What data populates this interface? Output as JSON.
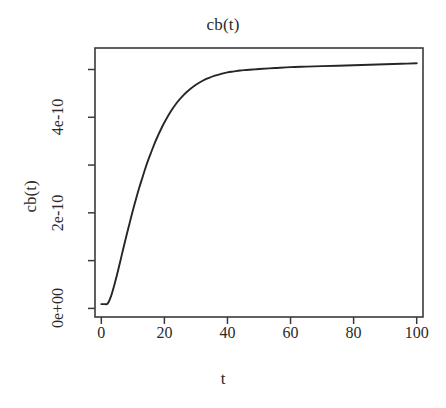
{
  "chart_data": {
    "type": "line",
    "title": "cb(t)",
    "xlabel": "t",
    "ylabel": "cb(t)",
    "xlim": [
      -2,
      102
    ],
    "ylim": [
      -1.8e-11,
      5.45e-10
    ],
    "grid": false,
    "legend": null,
    "x_ticks": [
      {
        "value": 0,
        "label": "0",
        "labeled": true
      },
      {
        "value": 20,
        "label": "20",
        "labeled": true
      },
      {
        "value": 40,
        "label": "40",
        "labeled": true
      },
      {
        "value": 60,
        "label": "60",
        "labeled": true
      },
      {
        "value": 80,
        "label": "80",
        "labeled": true
      },
      {
        "value": 100,
        "label": "100",
        "labeled": true
      }
    ],
    "y_ticks": [
      {
        "value": 0,
        "label": "0e+00",
        "labeled": true
      },
      {
        "value": 1e-10,
        "label": "",
        "labeled": false
      },
      {
        "value": 2e-10,
        "label": "2e-10",
        "labeled": true
      },
      {
        "value": 3e-10,
        "label": "",
        "labeled": false
      },
      {
        "value": 4e-10,
        "label": "4e-10",
        "labeled": true
      },
      {
        "value": 5e-10,
        "label": "",
        "labeled": false
      }
    ],
    "line_color": "#262626",
    "line_width": 1.9,
    "series": [
      {
        "name": "cb(t)",
        "x": [
          0,
          1,
          2,
          3,
          4,
          5,
          6,
          7,
          8,
          9,
          10,
          11,
          12,
          13,
          14,
          15,
          16,
          17,
          18,
          19,
          20,
          22,
          24,
          26,
          28,
          30,
          32,
          34,
          36,
          38,
          40,
          42,
          44,
          46,
          48,
          50,
          55,
          60,
          65,
          70,
          75,
          80,
          85,
          90,
          95,
          100
        ],
        "y": [
          9e-12,
          9e-12,
          1e-11,
          2.4e-11,
          4.6e-11,
          7.1e-11,
          9.8e-11,
          1.26e-10,
          1.53e-10,
          1.79e-10,
          2.05e-10,
          2.29e-10,
          2.52e-10,
          2.73e-10,
          2.94e-10,
          3.13e-10,
          3.3e-10,
          3.47e-10,
          3.62e-10,
          3.76e-10,
          3.89e-10,
          4.12e-10,
          4.31e-10,
          4.46e-10,
          4.58e-10,
          4.68e-10,
          4.76e-10,
          4.82e-10,
          4.87e-10,
          4.91e-10,
          4.94e-10,
          4.96e-10,
          4.98e-10,
          4.99e-10,
          5e-10,
          5.01e-10,
          5.03e-10,
          5.05e-10,
          5.06e-10,
          5.07e-10,
          5.08e-10,
          5.09e-10,
          5.1e-10,
          5.11e-10,
          5.12e-10,
          5.13e-10
        ]
      }
    ]
  }
}
